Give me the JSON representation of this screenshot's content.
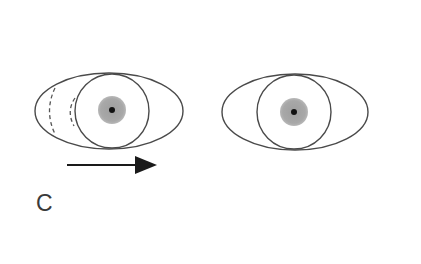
{
  "figure": {
    "panel_label": "C",
    "colors": {
      "outline": "#4a4a4a",
      "pupil_gray": "#a8a8a8",
      "pupil_center": "#111111",
      "arrow": "#1a1a1a",
      "background": "#ffffff"
    },
    "eyes": [
      {
        "id": "left-eye",
        "ellipse": {
          "cx": 109,
          "cy": 111,
          "rx": 74,
          "ry": 38
        },
        "iris": {
          "cx": 112,
          "cy": 111,
          "r": 37
        },
        "pupil": {
          "cx": 112,
          "cy": 110,
          "r": 14
        },
        "pupil_dot": {
          "r": 3
        },
        "dashed_arcs": true
      },
      {
        "id": "right-eye",
        "ellipse": {
          "cx": 295,
          "cy": 112,
          "rx": 73,
          "ry": 38
        },
        "iris": {
          "cx": 294,
          "cy": 112,
          "r": 37
        },
        "pupil": {
          "cx": 294,
          "cy": 112,
          "r": 14
        },
        "pupil_dot": {
          "r": 3
        },
        "dashed_arcs": false
      }
    ],
    "arrow": {
      "direction": "right",
      "x1": 67,
      "y": 165,
      "x2": 157
    }
  }
}
